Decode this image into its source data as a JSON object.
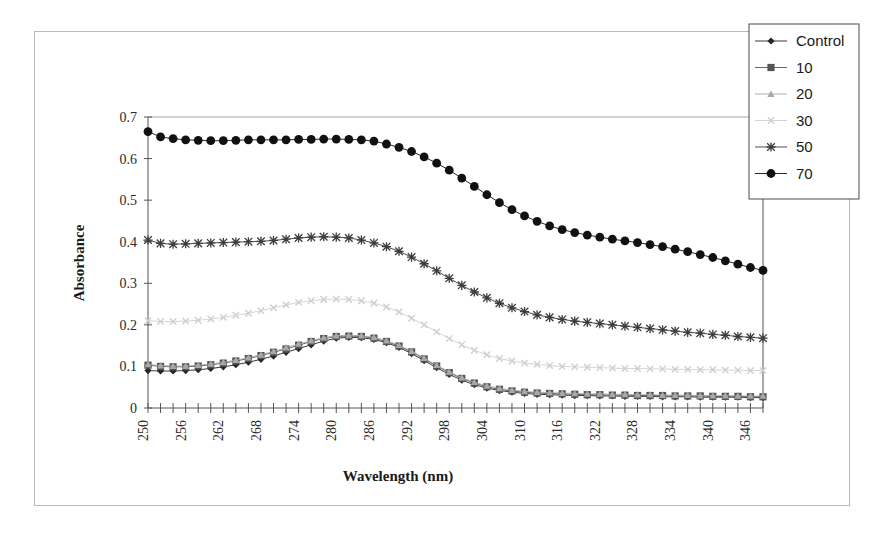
{
  "chart_data": {
    "type": "line",
    "title": "",
    "xlabel": "Wavelength (nm)",
    "ylabel": "Absorbance",
    "xlim": [
      250,
      348
    ],
    "ylim": [
      0,
      0.7
    ],
    "x_tick_step": 2,
    "x_label_step": 6,
    "y_ticks": [
      "0",
      "0.1",
      "0.2",
      "0.3",
      "0.4",
      "0.5",
      "0.6",
      "0.7"
    ],
    "y_tick_values": [
      0,
      0.1,
      0.2,
      0.3,
      0.4,
      0.5,
      0.6,
      0.7
    ],
    "x_tick_labels": [
      "250",
      "256",
      "262",
      "268",
      "274",
      "280",
      "286",
      "292",
      "298",
      "304",
      "310",
      "316",
      "322",
      "328",
      "334",
      "340",
      "346"
    ],
    "grid": "horizontal-top-only",
    "legend_position": "top-right-outside",
    "x": [
      250,
      252,
      254,
      256,
      258,
      260,
      262,
      264,
      266,
      268,
      270,
      272,
      274,
      276,
      278,
      280,
      282,
      284,
      286,
      288,
      290,
      292,
      294,
      296,
      298,
      300,
      302,
      304,
      306,
      308,
      310,
      312,
      314,
      316,
      318,
      320,
      322,
      324,
      326,
      328,
      330,
      332,
      334,
      336,
      338,
      340,
      342,
      344,
      346,
      348
    ],
    "series": [
      {
        "name": "Control",
        "marker": "diamond",
        "color": "#262626",
        "values": [
          0.09,
          0.089,
          0.089,
          0.09,
          0.092,
          0.095,
          0.099,
          0.104,
          0.11,
          0.117,
          0.125,
          0.134,
          0.143,
          0.152,
          0.161,
          0.168,
          0.17,
          0.169,
          0.165,
          0.157,
          0.146,
          0.131,
          0.114,
          0.097,
          0.081,
          0.067,
          0.056,
          0.048,
          0.042,
          0.038,
          0.035,
          0.033,
          0.032,
          0.031,
          0.03,
          0.03,
          0.029,
          0.029,
          0.028,
          0.028,
          0.028,
          0.027,
          0.027,
          0.027,
          0.026,
          0.026,
          0.026,
          0.026,
          0.025,
          0.025
        ]
      },
      {
        "name": "10",
        "marker": "square",
        "color": "#545454",
        "values": [
          0.103,
          0.1,
          0.099,
          0.099,
          0.101,
          0.104,
          0.108,
          0.113,
          0.119,
          0.126,
          0.134,
          0.142,
          0.151,
          0.16,
          0.167,
          0.172,
          0.173,
          0.172,
          0.168,
          0.16,
          0.149,
          0.135,
          0.118,
          0.101,
          0.085,
          0.071,
          0.06,
          0.051,
          0.045,
          0.041,
          0.038,
          0.036,
          0.035,
          0.034,
          0.033,
          0.032,
          0.032,
          0.031,
          0.031,
          0.03,
          0.03,
          0.03,
          0.029,
          0.029,
          0.029,
          0.028,
          0.028,
          0.028,
          0.027,
          0.027
        ]
      },
      {
        "name": "20",
        "marker": "triangle",
        "color": "#a8a8a8",
        "values": [
          0.105,
          0.102,
          0.101,
          0.101,
          0.103,
          0.106,
          0.11,
          0.115,
          0.121,
          0.128,
          0.136,
          0.145,
          0.154,
          0.162,
          0.169,
          0.174,
          0.175,
          0.174,
          0.17,
          0.162,
          0.151,
          0.137,
          0.12,
          0.103,
          0.087,
          0.073,
          0.062,
          0.053,
          0.047,
          0.043,
          0.04,
          0.038,
          0.037,
          0.036,
          0.035,
          0.034,
          0.034,
          0.033,
          0.033,
          0.032,
          0.032,
          0.031,
          0.031,
          0.031,
          0.03,
          0.03,
          0.03,
          0.029,
          0.029,
          0.029
        ]
      },
      {
        "name": "30",
        "marker": "cross",
        "color": "#cfcfcf",
        "values": [
          0.21,
          0.208,
          0.208,
          0.209,
          0.211,
          0.214,
          0.218,
          0.223,
          0.228,
          0.234,
          0.241,
          0.248,
          0.254,
          0.258,
          0.261,
          0.262,
          0.261,
          0.258,
          0.252,
          0.243,
          0.231,
          0.216,
          0.2,
          0.183,
          0.167,
          0.152,
          0.139,
          0.128,
          0.119,
          0.113,
          0.108,
          0.105,
          0.102,
          0.1,
          0.099,
          0.098,
          0.097,
          0.096,
          0.095,
          0.095,
          0.094,
          0.094,
          0.093,
          0.093,
          0.092,
          0.092,
          0.091,
          0.091,
          0.09,
          0.09
        ]
      },
      {
        "name": "50",
        "marker": "asterisk",
        "color": "#3d3d3d",
        "values": [
          0.404,
          0.396,
          0.394,
          0.395,
          0.396,
          0.397,
          0.398,
          0.399,
          0.4,
          0.401,
          0.403,
          0.406,
          0.409,
          0.411,
          0.412,
          0.411,
          0.409,
          0.404,
          0.397,
          0.388,
          0.377,
          0.363,
          0.347,
          0.33,
          0.312,
          0.295,
          0.279,
          0.265,
          0.252,
          0.241,
          0.232,
          0.224,
          0.218,
          0.213,
          0.209,
          0.206,
          0.203,
          0.2,
          0.197,
          0.194,
          0.191,
          0.188,
          0.185,
          0.182,
          0.18,
          0.177,
          0.175,
          0.172,
          0.17,
          0.168
        ]
      },
      {
        "name": "70",
        "marker": "circle",
        "color": "#111111",
        "values": [
          0.665,
          0.652,
          0.648,
          0.645,
          0.644,
          0.643,
          0.643,
          0.644,
          0.645,
          0.645,
          0.645,
          0.645,
          0.646,
          0.646,
          0.647,
          0.647,
          0.646,
          0.645,
          0.642,
          0.635,
          0.627,
          0.617,
          0.604,
          0.589,
          0.572,
          0.553,
          0.533,
          0.513,
          0.494,
          0.477,
          0.462,
          0.449,
          0.438,
          0.429,
          0.422,
          0.416,
          0.411,
          0.406,
          0.402,
          0.398,
          0.393,
          0.388,
          0.382,
          0.376,
          0.369,
          0.362,
          0.354,
          0.346,
          0.338,
          0.331
        ]
      }
    ]
  },
  "legend": {
    "entries": [
      {
        "label": "Control",
        "marker": "diamond"
      },
      {
        "label": "10",
        "marker": "square"
      },
      {
        "label": "20",
        "marker": "triangle"
      },
      {
        "label": "30",
        "marker": "cross"
      },
      {
        "label": "50",
        "marker": "asterisk"
      },
      {
        "label": "70",
        "marker": "circle"
      }
    ]
  },
  "colors": {
    "frame": "#b9b9b9",
    "axis": "#555555",
    "grid": "#8e8e8e",
    "background": "#ffffff"
  }
}
